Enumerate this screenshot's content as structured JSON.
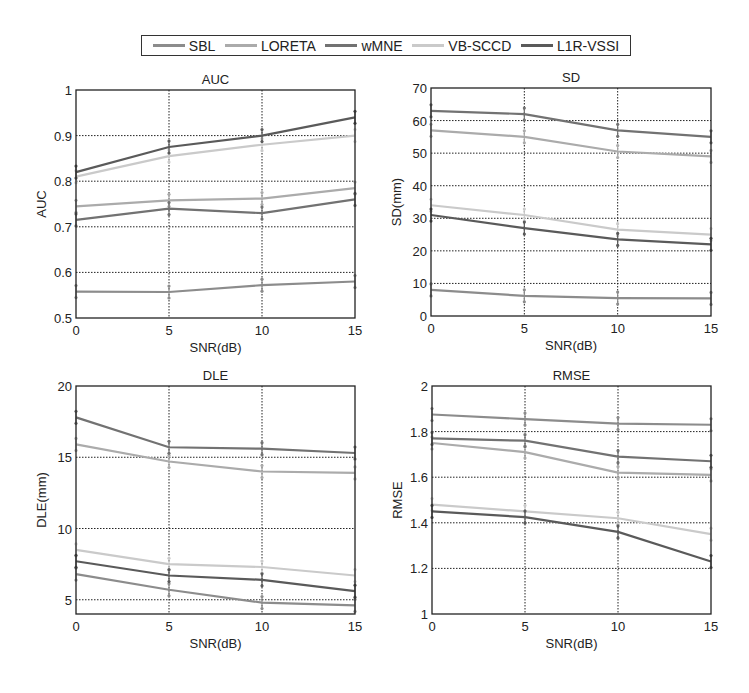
{
  "legend": {
    "items": [
      {
        "name": "SBL",
        "color": "#8c8c8c"
      },
      {
        "name": "LORETA",
        "color": "#ababab"
      },
      {
        "name": "wMNE",
        "color": "#727272"
      },
      {
        "name": "VB-SCCD",
        "color": "#cacaca"
      },
      {
        "name": "L1R-VSSI",
        "color": "#5a5a5a"
      }
    ]
  },
  "chart_data": [
    {
      "type": "line",
      "title": "AUC",
      "xlabel": "SNR(dB)",
      "ylabel": "AUC",
      "x": [
        0,
        5,
        10,
        15
      ],
      "xticks": [
        0,
        5,
        10,
        15
      ],
      "yticks": [
        0.5,
        0.6,
        0.7,
        0.8,
        0.9,
        1
      ],
      "ytick_labels": [
        "0.5",
        "0.6",
        "0.7",
        "0.8",
        "0.9",
        "1"
      ],
      "ylim": [
        0.5,
        1
      ],
      "xlim": [
        0,
        15
      ],
      "grid": true,
      "series": [
        {
          "name": "SBL",
          "values": [
            0.558,
            0.557,
            0.572,
            0.58
          ]
        },
        {
          "name": "LORETA",
          "values": [
            0.745,
            0.758,
            0.762,
            0.785
          ]
        },
        {
          "name": "wMNE",
          "values": [
            0.715,
            0.74,
            0.73,
            0.76
          ]
        },
        {
          "name": "VB-SCCD",
          "values": [
            0.81,
            0.855,
            0.88,
            0.9
          ]
        },
        {
          "name": "L1R-VSSI",
          "values": [
            0.82,
            0.875,
            0.9,
            0.94
          ]
        }
      ]
    },
    {
      "type": "line",
      "title": "SD",
      "xlabel": "SNR(dB)",
      "ylabel": "SD(mm)",
      "x": [
        0,
        5,
        10,
        15
      ],
      "xticks": [
        0,
        5,
        10,
        15
      ],
      "yticks": [
        0,
        10,
        20,
        30,
        40,
        50,
        60,
        70
      ],
      "ytick_labels": [
        "0",
        "10",
        "20",
        "30",
        "40",
        "50",
        "60",
        "70"
      ],
      "ylim": [
        0,
        70
      ],
      "xlim": [
        0,
        15
      ],
      "grid": true,
      "series": [
        {
          "name": "SBL",
          "values": [
            8,
            6.2,
            5.5,
            5.4
          ]
        },
        {
          "name": "LORETA",
          "values": [
            57,
            55,
            50.5,
            49
          ]
        },
        {
          "name": "wMNE",
          "values": [
            63,
            62,
            57,
            55
          ]
        },
        {
          "name": "VB-SCCD",
          "values": [
            34,
            31,
            26.5,
            25
          ]
        },
        {
          "name": "L1R-VSSI",
          "values": [
            31,
            27,
            23.5,
            22
          ]
        }
      ]
    },
    {
      "type": "line",
      "title": "DLE",
      "xlabel": "SNR(dB)",
      "ylabel": "DLE(mm)",
      "x": [
        0,
        5,
        10,
        15
      ],
      "xticks": [
        0,
        5,
        10,
        15
      ],
      "yticks": [
        5,
        10,
        15,
        20
      ],
      "ytick_labels": [
        "5",
        "10",
        "15",
        "20"
      ],
      "ylim": [
        4,
        20
      ],
      "xlim": [
        0,
        15
      ],
      "grid": true,
      "series": [
        {
          "name": "SBL",
          "values": [
            6.8,
            5.7,
            4.8,
            4.6
          ]
        },
        {
          "name": "LORETA",
          "values": [
            15.9,
            14.7,
            14.0,
            13.9
          ]
        },
        {
          "name": "wMNE",
          "values": [
            17.8,
            15.7,
            15.6,
            15.3
          ]
        },
        {
          "name": "VB-SCCD",
          "values": [
            8.5,
            7.5,
            7.3,
            6.7
          ]
        },
        {
          "name": "L1R-VSSI",
          "values": [
            7.7,
            6.7,
            6.4,
            5.6
          ]
        }
      ]
    },
    {
      "type": "line",
      "title": "RMSE",
      "xlabel": "SNR(dB)",
      "ylabel": "RMSE",
      "x": [
        0,
        5,
        10,
        15
      ],
      "xticks": [
        0,
        5,
        10,
        15
      ],
      "yticks": [
        1,
        1.2,
        1.4,
        1.6,
        1.8,
        2
      ],
      "ytick_labels": [
        "1",
        "1.2",
        "1.4",
        "1.6",
        "1.8",
        "2"
      ],
      "ylim": [
        1,
        2
      ],
      "xlim": [
        0,
        15
      ],
      "grid": true,
      "series": [
        {
          "name": "SBL",
          "values": [
            1.875,
            1.855,
            1.835,
            1.83
          ]
        },
        {
          "name": "LORETA",
          "values": [
            1.75,
            1.71,
            1.62,
            1.61
          ]
        },
        {
          "name": "wMNE",
          "values": [
            1.77,
            1.76,
            1.69,
            1.67
          ]
        },
        {
          "name": "VB-SCCD",
          "values": [
            1.48,
            1.45,
            1.42,
            1.35
          ]
        },
        {
          "name": "L1R-VSSI",
          "values": [
            1.45,
            1.425,
            1.36,
            1.23
          ]
        }
      ]
    }
  ]
}
